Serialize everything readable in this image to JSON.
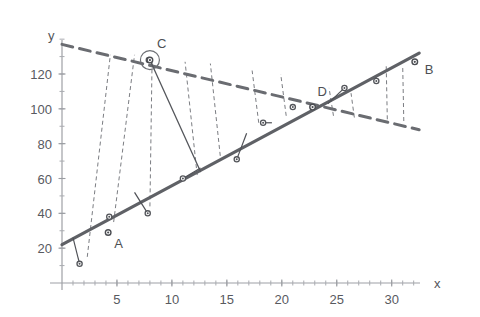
{
  "chart_data": {
    "type": "scatter",
    "title": "",
    "subtitle": "",
    "xlabel": "x",
    "ylabel": "y",
    "xlim": [
      0,
      32.5
    ],
    "ylim": [
      0,
      143
    ],
    "grid": false,
    "legend": null,
    "x_ticks_major": [
      5,
      10,
      15,
      20,
      25,
      30
    ],
    "x_tick_labels": [
      "5",
      "10",
      "15",
      "20",
      "25",
      "30"
    ],
    "x_tick_minor_step": 1,
    "y_ticks_major": [
      20,
      40,
      60,
      80,
      100,
      120
    ],
    "y_tick_labels": [
      "20",
      "40",
      "60",
      "80",
      "100",
      "120"
    ],
    "y_tick_minor_step": 10,
    "points": [
      {
        "x": 1.6,
        "y": 11
      },
      {
        "x": 4.3,
        "y": 38
      },
      {
        "x": 7.8,
        "y": 40
      },
      {
        "x": 11.0,
        "y": 60
      },
      {
        "x": 15.9,
        "y": 71
      },
      {
        "x": 18.3,
        "y": 92
      },
      {
        "x": 21.0,
        "y": 101
      },
      {
        "x": 25.7,
        "y": 112
      },
      {
        "x": 28.6,
        "y": 116
      },
      {
        "x": 7.9,
        "y": 128
      }
    ],
    "labeled_points": [
      {
        "name": "A",
        "x": 4.2,
        "y": 29,
        "label_dx": 6,
        "label_dy": 16
      },
      {
        "name": "B",
        "x": 32.1,
        "y": 127,
        "label_dx": 10,
        "label_dy": 12
      },
      {
        "name": "C",
        "x": 8.0,
        "y": 128,
        "label_dx": 7,
        "label_dy": -12,
        "circled": true
      },
      {
        "name": "D",
        "x": 22.8,
        "y": 101,
        "label_dx": 5,
        "label_dy": -11
      }
    ],
    "series": [
      {
        "name": "regression-line",
        "style": "solid-thick",
        "color": "#5f6166",
        "x": [
          0,
          32.5
        ],
        "y": [
          22,
          132
        ]
      },
      {
        "name": "dashed-trend-line",
        "style": "dashed-thick",
        "color": "#6a6c71",
        "x": [
          0,
          32.5
        ],
        "y": [
          137,
          88
        ]
      },
      {
        "name": "segment-C-to-line",
        "style": "solid-thin",
        "color": "#55575c",
        "x": [
          8.0,
          12.6
        ],
        "y": [
          128,
          64
        ]
      }
    ],
    "residual_connectors": [
      {
        "from_x": 1.6,
        "from_y": 11,
        "to_x": 1.0,
        "to_y": 26
      },
      {
        "from_x": 7.8,
        "from_y": 40,
        "to_x": 6.6,
        "to_y": 52
      },
      {
        "from_x": 11.0,
        "from_y": 60,
        "to_x": 12.6,
        "to_y": 66
      },
      {
        "from_x": 15.9,
        "from_y": 71,
        "to_x": 16.8,
        "to_y": 86
      },
      {
        "from_x": 18.3,
        "from_y": 92,
        "to_x": 19.1,
        "to_y": 92
      },
      {
        "from_x": 25.7,
        "from_y": 112,
        "to_x": 24.2,
        "to_y": 103
      },
      {
        "from_x": 28.6,
        "from_y": 116,
        "to_x": 28.6,
        "to_y": 118
      }
    ],
    "annotation_dashes": [
      {
        "x1": 2.3,
        "y1": 15,
        "x2": 4.4,
        "y2": 131
      },
      {
        "x1": 4.7,
        "y1": 35,
        "x2": 6.6,
        "y2": 131
      },
      {
        "x1": 8.0,
        "y1": 44,
        "x2": 8.2,
        "y2": 129
      },
      {
        "x1": 12.3,
        "y1": 62,
        "x2": 11.2,
        "y2": 127
      },
      {
        "x1": 14.4,
        "y1": 73,
        "x2": 13.5,
        "y2": 126
      },
      {
        "x1": 17.9,
        "y1": 92,
        "x2": 17.3,
        "y2": 122
      },
      {
        "x1": 20.4,
        "y1": 96,
        "x2": 19.9,
        "y2": 120
      },
      {
        "x1": 24.7,
        "y1": 96,
        "x2": 24.3,
        "y2": 112
      },
      {
        "x1": 26.6,
        "y1": 95,
        "x2": 26.3,
        "y2": 109
      },
      {
        "x1": 29.6,
        "y1": 94,
        "x2": 29.5,
        "y2": 125
      },
      {
        "x1": 31.1,
        "y1": 93,
        "x2": 31.0,
        "y2": 125
      }
    ]
  },
  "figure": {
    "name": "scatter-regression-figure",
    "x_axis_label": "x",
    "y_axis_label": "y",
    "background_color": "#ffffff",
    "line_color": "#5f6166",
    "dash_color": "#6a6c71",
    "text_color": "#55575c"
  }
}
